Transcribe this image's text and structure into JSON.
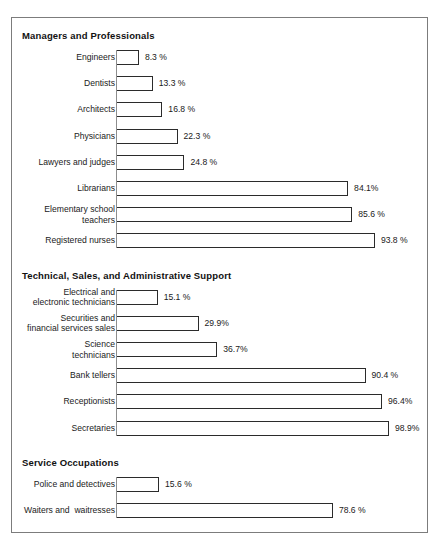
{
  "chart_data": {
    "type": "bar",
    "title": "",
    "xlabel": "",
    "ylabel": "",
    "orientation": "horizontal",
    "xlim": [
      0,
      100
    ],
    "grid": false,
    "legend": null,
    "unit": "%",
    "groups": [
      {
        "header": "Managers and Professionals",
        "items": [
          {
            "label": "Engineers",
            "value": 8.3,
            "value_label": "8.3 %"
          },
          {
            "label": "Dentists",
            "value": 13.3,
            "value_label": "13.3 %"
          },
          {
            "label": "Architects",
            "value": 16.8,
            "value_label": "16.8 %"
          },
          {
            "label": "Physicians",
            "value": 22.3,
            "value_label": "22.3 %"
          },
          {
            "label": "Lawyers and judges",
            "value": 24.8,
            "value_label": "24.8 %"
          },
          {
            "label": "Librarians",
            "value": 84.1,
            "value_label": "84.1%"
          },
          {
            "label": "Elementary school\nteachers",
            "value": 85.6,
            "value_label": "85.6 %"
          },
          {
            "label": "Registered nurses",
            "value": 93.8,
            "value_label": "93.8 %"
          }
        ]
      },
      {
        "header": "Technical, Sales, and Administrative Support",
        "items": [
          {
            "label": "Electrical and\nelectronic technicians",
            "value": 15.1,
            "value_label": "15.1 %"
          },
          {
            "label": "Securities and\nfinancial services sales",
            "value": 29.9,
            "value_label": "29.9%"
          },
          {
            "label": "Science\ntechnicians",
            "value": 36.7,
            "value_label": "36.7%"
          },
          {
            "label": "Bank tellers",
            "value": 90.4,
            "value_label": "90.4 %"
          },
          {
            "label": "Receptionists",
            "value": 96.4,
            "value_label": "96.4%"
          },
          {
            "label": "Secretaries",
            "value": 98.9,
            "value_label": "98.9%"
          }
        ]
      },
      {
        "header": "Service Occupations",
        "items": [
          {
            "label": "Police and detectives",
            "value": 15.6,
            "value_label": "15.6 %"
          },
          {
            "label": "Waiters and  waitresses",
            "value": 78.6,
            "value_label": "78.6 %"
          }
        ]
      }
    ]
  },
  "style": {
    "bar_border_color": "#2b2b2b",
    "bar_fill_color": "#ffffff",
    "frame_border_color": "#7c7c7c",
    "text_color": "#1a1a1a"
  }
}
